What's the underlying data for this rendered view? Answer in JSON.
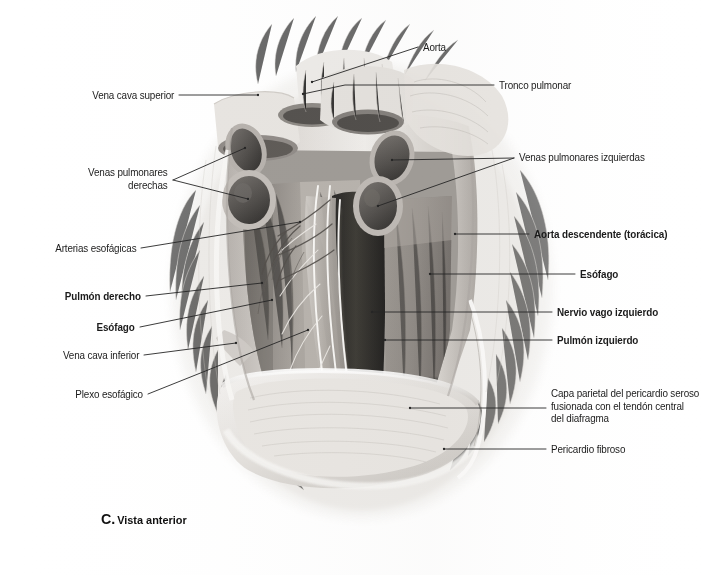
{
  "figure": {
    "caption_letter": "C.",
    "caption_text": "Vista anterior",
    "medium": "grayscale-anatomical-illustration",
    "palette": {
      "background": "#ffffff",
      "ink": "#1b1b1b",
      "leader": "#262626",
      "tissue_light": "#e9e7e4",
      "tissue_mid": "#b9b5b0",
      "tissue_dark": "#6e6a66",
      "vessel_lumen": "#4a4744",
      "aorta_shadow": "#2b2927",
      "lung_tone": "#8f8a85",
      "pericardium": "#dedbd7"
    }
  },
  "labels": [
    {
      "id": "aorta",
      "text": "Aorta",
      "side": "right",
      "bold": false,
      "text_x": 423,
      "text_y": 41,
      "leader": [
        [
          418,
          47
        ],
        [
          312,
          82
        ]
      ]
    },
    {
      "id": "tronco-pulmonar",
      "text": "Tronco pulmonar",
      "side": "right",
      "bold": false,
      "text_x": 499,
      "text_y": 79,
      "leader": [
        [
          494,
          85
        ],
        [
          345,
          85
        ],
        [
          303,
          94
        ]
      ]
    },
    {
      "id": "vena-cava-superior",
      "text": "Vena cava superior",
      "side": "left",
      "bold": false,
      "text_x": 174,
      "text_y": 89,
      "leader": [
        [
          179,
          95
        ],
        [
          258,
          95
        ]
      ]
    },
    {
      "id": "venas-pulmonares-derechas",
      "text": "Venas pulmonares\nderechas",
      "side": "left",
      "bold": false,
      "text_x": 168,
      "text_y": 166,
      "leader_fork": {
        "apex": [
          173,
          180
        ],
        "ends": [
          [
            245,
            148
          ],
          [
            248,
            199
          ]
        ]
      }
    },
    {
      "id": "venas-pulmonares-izquierdas",
      "text": "Venas pulmonares izquierdas",
      "side": "right",
      "bold": false,
      "text_x": 519,
      "text_y": 151,
      "leader_fork": {
        "apex": [
          514,
          158
        ],
        "ends": [
          [
            392,
            160
          ],
          [
            378,
            206
          ]
        ]
      }
    },
    {
      "id": "aorta-descendente",
      "text": "Aorta descendente (torácica)",
      "side": "right",
      "bold": true,
      "text_x": 534,
      "text_y": 228,
      "leader": [
        [
          529,
          234
        ],
        [
          455,
          234
        ]
      ]
    },
    {
      "id": "arterias-esofagicas",
      "text": "Arterias esofágicas",
      "side": "left",
      "bold": false,
      "text_x": 136,
      "text_y": 242,
      "leader": [
        [
          141,
          248
        ],
        [
          300,
          222
        ]
      ]
    },
    {
      "id": "esofago-derecho",
      "text": "Esófago",
      "side": "right",
      "bold": true,
      "text_x": 580,
      "text_y": 268,
      "leader": [
        [
          575,
          274
        ],
        [
          430,
          274
        ]
      ]
    },
    {
      "id": "pulmon-derecho",
      "text": "Pulmón derecho",
      "side": "left",
      "bold": true,
      "text_x": 141,
      "text_y": 290,
      "leader": [
        [
          146,
          296
        ],
        [
          262,
          283
        ]
      ]
    },
    {
      "id": "nervio-vago-izquierdo",
      "text": "Nervio vago izquierdo",
      "side": "right",
      "bold": true,
      "text_x": 557,
      "text_y": 306,
      "leader": [
        [
          552,
          312
        ],
        [
          372,
          312
        ]
      ]
    },
    {
      "id": "esofago-izquierdo",
      "text": "Esófago",
      "side": "left",
      "bold": true,
      "text_x": 135,
      "text_y": 321,
      "leader": [
        [
          140,
          327
        ],
        [
          272,
          300
        ]
      ]
    },
    {
      "id": "pulmon-izquierdo",
      "text": "Pulmón izquierdo",
      "side": "right",
      "bold": true,
      "text_x": 557,
      "text_y": 334,
      "leader": [
        [
          552,
          340
        ],
        [
          385,
          340
        ]
      ]
    },
    {
      "id": "vena-cava-inferior",
      "text": "Vena cava inferior",
      "side": "left",
      "bold": false,
      "text_x": 139,
      "text_y": 349,
      "leader": [
        [
          144,
          355
        ],
        [
          236,
          343
        ]
      ]
    },
    {
      "id": "plexo-esofagico",
      "text": "Plexo esofágico",
      "side": "left",
      "bold": false,
      "text_x": 143,
      "text_y": 388,
      "leader": [
        [
          148,
          394
        ],
        [
          308,
          330
        ]
      ]
    },
    {
      "id": "capa-parietal-pericardio",
      "text": "Capa parietal del pericardio seroso\nfusionada con el tendón central\ndel diafragma",
      "side": "right",
      "bold": false,
      "text_x": 551,
      "text_y": 387,
      "leader": [
        [
          546,
          408
        ],
        [
          410,
          408
        ]
      ]
    },
    {
      "id": "pericardio-fibroso",
      "text": "Pericardio fibroso",
      "side": "right",
      "bold": false,
      "text_x": 551,
      "text_y": 443,
      "leader": [
        [
          546,
          449
        ],
        [
          444,
          449
        ]
      ]
    }
  ]
}
